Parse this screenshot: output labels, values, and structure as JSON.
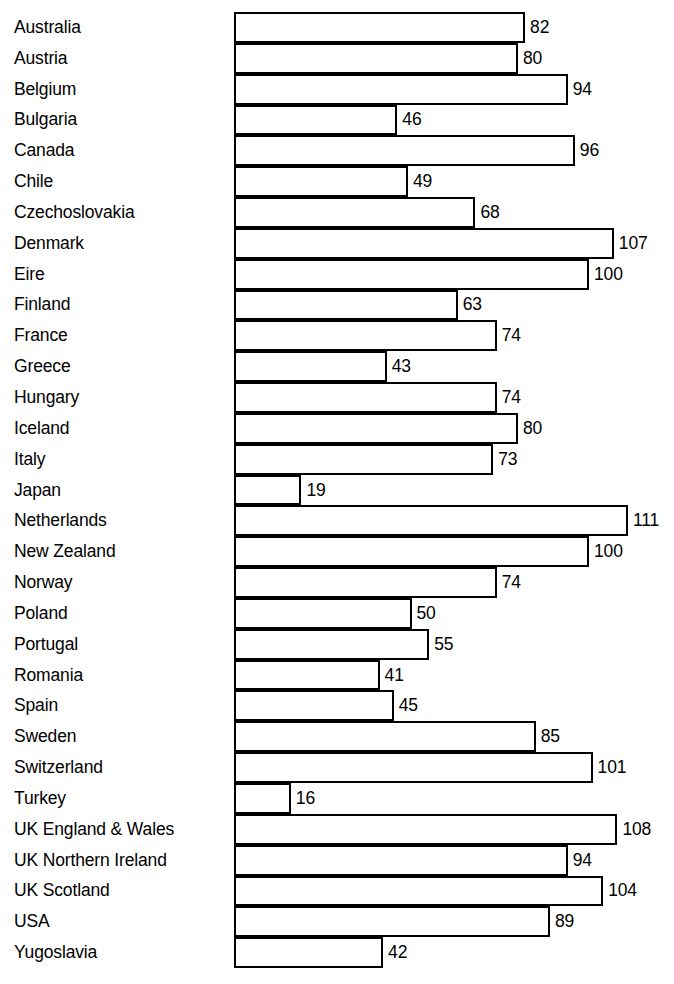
{
  "chart_data": {
    "type": "bar",
    "orientation": "horizontal",
    "title": "",
    "subtitle": "",
    "xlabel": "",
    "ylabel": "",
    "grid": false,
    "legend": null,
    "legend_position": "none",
    "xlim": [
      0,
      111
    ],
    "value_labels_shown": true,
    "bar_style": {
      "fill": "#ffffff",
      "stroke": "#000000",
      "stroke_width": 2
    },
    "categories": [
      "Australia",
      "Austria",
      "Belgium",
      "Bulgaria",
      "Canada",
      "Chile",
      "Czechoslovakia",
      "Denmark",
      "Eire",
      "Finland",
      "France",
      "Greece",
      "Hungary",
      "Iceland",
      "Italy",
      "Japan",
      "Netherlands",
      "New Zealand",
      "Norway",
      "Poland",
      "Portugal",
      "Romania",
      "Spain",
      "Sweden",
      "Switzerland",
      "Turkey",
      "UK England & Wales",
      "UK Northern Ireland",
      "UK Scotland",
      "USA",
      "Yugoslavia"
    ],
    "values": [
      82,
      80,
      94,
      46,
      96,
      49,
      68,
      107,
      100,
      63,
      74,
      43,
      74,
      80,
      73,
      19,
      111,
      100,
      74,
      50,
      55,
      41,
      45,
      85,
      101,
      16,
      108,
      94,
      104,
      89,
      42
    ]
  },
  "geometry": {
    "baseline_x": 234,
    "px_per_unit": 3.55,
    "chart_top": 12,
    "row_pitch": 30.84,
    "value_gap": 5
  }
}
